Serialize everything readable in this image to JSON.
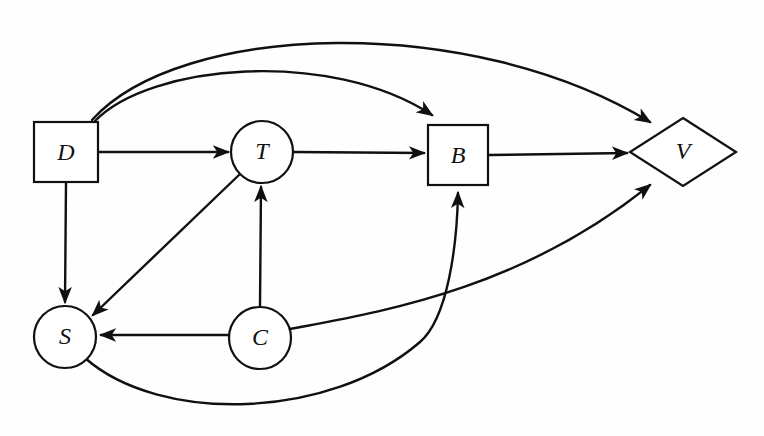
{
  "diagram": {
    "background_color": "#fefefe",
    "stroke_color": "#101010",
    "node_fill_color": "#ffffff",
    "nodes": [
      {
        "id": "D",
        "label": "D",
        "shape": "square",
        "cx": 66,
        "cy": 152,
        "w": 64,
        "h": 60
      },
      {
        "id": "T",
        "label": "T",
        "shape": "circle",
        "cx": 262,
        "cy": 152,
        "r": 30
      },
      {
        "id": "B",
        "label": "B",
        "shape": "square",
        "cx": 458,
        "cy": 155,
        "w": 60,
        "h": 60
      },
      {
        "id": "V",
        "label": "V",
        "shape": "diamond",
        "cx": 683,
        "cy": 152,
        "rx": 53,
        "ry": 34
      },
      {
        "id": "S",
        "label": "S",
        "shape": "circle",
        "cx": 65,
        "cy": 337,
        "r": 30
      },
      {
        "id": "C",
        "label": "C",
        "shape": "circle",
        "cx": 260,
        "cy": 338,
        "r": 30
      }
    ],
    "edges": [
      {
        "id": "D-T",
        "from": "D",
        "to": "T",
        "style": "straight"
      },
      {
        "id": "T-B",
        "from": "T",
        "to": "B",
        "style": "straight"
      },
      {
        "id": "B-V",
        "from": "B",
        "to": "V",
        "style": "straight"
      },
      {
        "id": "D-S",
        "from": "D",
        "to": "S",
        "style": "straight"
      },
      {
        "id": "T-S",
        "from": "T",
        "to": "S",
        "style": "straight-diagonal"
      },
      {
        "id": "C-T",
        "from": "C",
        "to": "T",
        "style": "straight"
      },
      {
        "id": "C-S",
        "from": "C",
        "to": "S",
        "style": "straight"
      },
      {
        "id": "D-B",
        "from": "D",
        "to": "B",
        "style": "arc-above"
      },
      {
        "id": "D-V",
        "from": "D",
        "to": "V",
        "style": "arc-above-outer"
      },
      {
        "id": "S-B",
        "from": "S",
        "to": "B",
        "style": "arc-below"
      },
      {
        "id": "C-V",
        "from": "C",
        "to": "V",
        "style": "arc-below-outer"
      }
    ]
  }
}
